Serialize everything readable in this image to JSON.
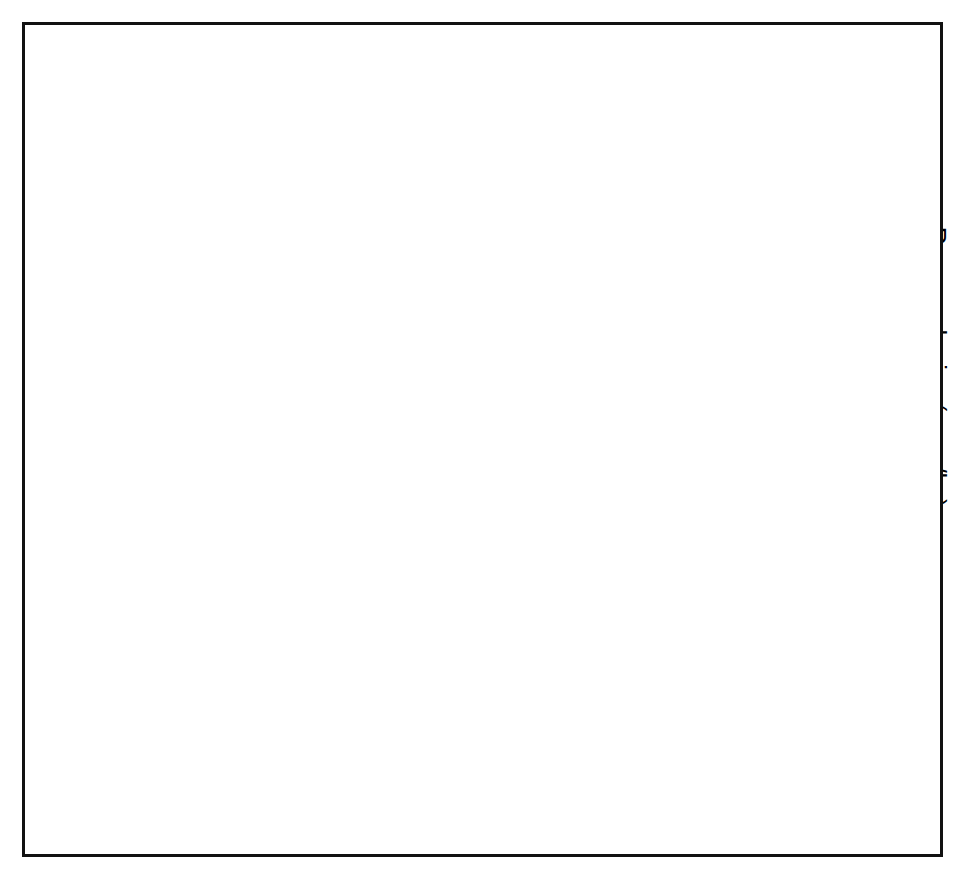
{
  "figure": {
    "border_color": "#111111",
    "ink_color": "#000000"
  },
  "axes": {
    "x": {
      "label": "Year",
      "min": 1948,
      "max": 1995,
      "major_step": 5,
      "minor_step": 1,
      "ticks": [
        "1950",
        "1955",
        "1960",
        "1965",
        "1970",
        "1975",
        "1980",
        "1985",
        "1990",
        "1995"
      ],
      "tick_values": [
        1950,
        1955,
        1960,
        1965,
        1970,
        1975,
        1980,
        1985,
        1990,
        1995
      ]
    },
    "y_left": {
      "label": "Sheep (million head)",
      "min": 0,
      "max": 140,
      "step": 20,
      "ticks": [
        "0",
        "20",
        "40",
        "60",
        "80",
        "100",
        "120",
        "140"
      ],
      "tick_values": [
        0,
        20,
        40,
        60,
        80,
        100,
        120,
        140
      ]
    },
    "y_right": {
      "label": "Raw wool price (yuan/kg)",
      "min": 0,
      "max": 12,
      "step": 2,
      "ticks": [
        "0",
        "2",
        "4",
        "6",
        "8",
        "10",
        "12"
      ],
      "tick_values": [
        0,
        2,
        4,
        6,
        8,
        10,
        12
      ]
    }
  },
  "legend": {
    "items": [
      {
        "label": "Sheep numbers",
        "marker": "filled-square-marker"
      },
      {
        "label": "Wool price (aver.)",
        "marker": "bowtie-marker"
      }
    ]
  },
  "annotations": {
    "arrows": [
      {
        "id": "unified-purchase",
        "lines": [
          "Unified purchase",
          "system introduced"
        ],
        "text_x": 1955.6,
        "text_y_px": 334,
        "arrow_x": 1956.0,
        "arrow_top_px": 368,
        "arrow_bottom_px": 422
      },
      {
        "id": "economic-reforms",
        "lines": [
          "Start of",
          "economic",
          "reforms"
        ],
        "text_x": 1979.0,
        "text_y_px": 118,
        "arrow_x": 1979.0,
        "arrow_top_px": 192,
        "arrow_bottom_px": 240
      },
      {
        "id": "wool-marketing-reforms",
        "lines": [
          "Start",
          "of",
          "wool",
          "marketing",
          "reforms"
        ],
        "text_x": 1985.0,
        "text_y_px": 118,
        "arrow_x": 1985.0,
        "arrow_top_px": 214,
        "arrow_bottom_px": 262
      },
      {
        "id": "wool-market-reopened",
        "lines": [
          "Wool",
          "market",
          "re-opened"
        ],
        "text_x": 1991.6,
        "text_y_px": 118,
        "arrow_x": 1991.6,
        "arrow_top_px": 186,
        "arrow_bottom_px": 234
      }
    ],
    "brackets": [
      {
        "id": "great-leap-forward",
        "lines": [
          "Great Leap",
          "Forward"
        ],
        "x_start": 1958.0,
        "x_end": 1961.0,
        "bracket_y_px": 536,
        "text_y_px": 560
      },
      {
        "id": "commune-era",
        "lines": [
          "Commune era"
        ],
        "x_start": 1956.2,
        "x_end": 1978.0,
        "bracket_y_px": 489,
        "text_y_px": 515,
        "text_x": 1969.0
      },
      {
        "id": "cultural-revolution",
        "lines": [
          "Cultural",
          "Revolution"
        ],
        "x_start": 1966.0,
        "x_end": 1977.0,
        "bracket_y_px": 551,
        "text_y_px": 575
      },
      {
        "id": "household-production",
        "lines": [
          "Household",
          "production responsibility",
          "system introduced"
        ],
        "x_start": 1983.0,
        "x_end": 1985.0,
        "bracket_y_px": 538,
        "text_y_px": 557
      },
      {
        "id": "wool-war-era",
        "lines": [
          "Wool",
          "War era"
        ],
        "x_start": 1985.2,
        "x_end": 1988.2,
        "bracket_y_px": 478,
        "text_y_px": 502
      },
      {
        "id": "smc-control",
        "lines": [
          "SMC control",
          "re-imposed"
        ],
        "x_start": 1988.5,
        "x_end": 1991.0,
        "bracket_y_px": 406,
        "text_y_px": 430
      }
    ]
  },
  "chart_data": {
    "type": "line",
    "title": "",
    "xlabel": "Year",
    "ylabel": "Sheep (million head)",
    "y2label": "Raw wool price (yuan/kg)",
    "xlim": [
      1948,
      1995
    ],
    "ylim": [
      0,
      140
    ],
    "y2lim": [
      0,
      12
    ],
    "grid": false,
    "legend_position": "bottom",
    "series": [
      {
        "name": "Sheep numbers",
        "axis": "left",
        "unit": "million head",
        "marker": "filled-square",
        "x": [
          1949,
          1950,
          1951,
          1952,
          1953,
          1954,
          1955,
          1956,
          1957,
          1958,
          1959,
          1960,
          1961,
          1962,
          1963,
          1964,
          1965,
          1970,
          1971,
          1972,
          1973,
          1974,
          1975,
          1976,
          1977,
          1978,
          1979,
          1980,
          1981,
          1982,
          1983,
          1984,
          1985,
          1986,
          1987,
          1988,
          1989,
          1990,
          1991,
          1992,
          1993
        ],
        "y": [
          26.0,
          26.3,
          30.0,
          33.0,
          37.5,
          39.5,
          43.0,
          46.5,
          49.5,
          53.0,
          53.0,
          51.0,
          62.0,
          61.5,
          61.5,
          66.5,
          78.8,
          86.5,
          87.5,
          90.5,
          94.0,
          94.5,
          93.8,
          95.5,
          97.5,
          97.0,
          97.5,
          102.5,
          106.5,
          108.8,
          105.0,
          100.0,
          95.5,
          97.0,
          102.5,
          110.0,
          113.5,
          113.8,
          111.5,
          111.0,
          112.5
        ]
      },
      {
        "name": "Wool price (aver.)",
        "axis": "right",
        "unit": "yuan/kg",
        "marker": "bowtie",
        "connected_from": 1978,
        "x": [
          1952,
          1965,
          1972,
          1975,
          1978,
          1979,
          1980,
          1981,
          1982,
          1983,
          1984,
          1985,
          1986,
          1987,
          1988,
          1989,
          1990,
          1991,
          1992
        ],
        "y": [
          2.1,
          2.18,
          3.05,
          3.1,
          3.42,
          3.4,
          3.45,
          3.48,
          3.52,
          3.6,
          3.78,
          5.15,
          6.1,
          6.35,
          10.85,
          9.15,
          6.75,
          6.05,
          7.0
        ]
      }
    ]
  }
}
